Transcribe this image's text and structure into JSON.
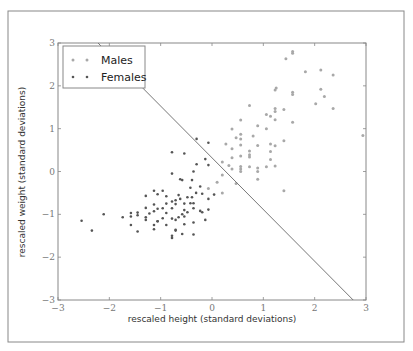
{
  "chart_data": {
    "type": "scatter",
    "title": "",
    "xlabel": "rescaled height (standard deviations)",
    "ylabel": "rescaled weight (standard deviations)",
    "xlim": [
      -3,
      3
    ],
    "ylim": [
      -3,
      3
    ],
    "xticks": [
      -3,
      -2,
      -1,
      0,
      1,
      2,
      3
    ],
    "yticks": [
      -3,
      -2,
      -1,
      0,
      1,
      2,
      3
    ],
    "grid": false,
    "legend_position": "upper left",
    "legend": [
      "Males",
      "Females"
    ],
    "colors": {
      "Males": "#a8a8a8",
      "Females": "#555555",
      "line": "#777777",
      "frame": "#888888"
    },
    "decision_boundary": {
      "x": [
        -2.22,
        2.75
      ],
      "y": [
        3.0,
        -3.0
      ]
    },
    "series": [
      {
        "name": "Males",
        "x": [
          1.44,
          1.57,
          1.57,
          1.25,
          1.82,
          2.12,
          2.36,
          1.23,
          0.73,
          1.23,
          1.4,
          1.57,
          1.57,
          2.02,
          2.19,
          2.12,
          1.57,
          2.36,
          0.56,
          1.06,
          0.89,
          0.39,
          1.14,
          1.23,
          1.23,
          1.06,
          0.8,
          0.89,
          1.4,
          0.27,
          0.56,
          0.39,
          0.73,
          0.56,
          0.47,
          0.56,
          0.39,
          0.56,
          1.14,
          1.14,
          1.14,
          0.73,
          2.94,
          0.2,
          0.33,
          0.56,
          0.56,
          0.89,
          1.06,
          1.23,
          0.2,
          0.39,
          0.56,
          0.73,
          0.89,
          1.4,
          0.2,
          -0.07,
          0.1,
          0.47,
          0.73,
          1.23,
          0.89
        ],
        "y": [
          2.63,
          2.76,
          2.8,
          1.95,
          2.33,
          2.37,
          2.25,
          1.47,
          1.54,
          1.9,
          1.45,
          1.8,
          1.85,
          1.58,
          1.75,
          1.92,
          1.15,
          1.47,
          1.2,
          1.33,
          1.07,
          0.99,
          1.29,
          1.21,
          1.4,
          1.0,
          0.83,
          0.61,
          0.72,
          0.64,
          0.62,
          0.53,
          0.48,
          0.76,
          0.79,
          0.87,
          0.32,
          0.36,
          0.64,
          0.47,
          0.28,
          0.34,
          0.84,
          0.22,
          0.14,
          0.12,
          -0.0,
          0.08,
          0.11,
          0.13,
          -0.08,
          0.06,
          0.06,
          0.11,
          -0.18,
          -0.45,
          -0.5,
          -0.4,
          -0.25,
          -0.28,
          0.39,
          0.6,
          0.0
        ]
      },
      {
        "name": "Females",
        "x": [
          -0.3,
          -0.07,
          -0.3,
          -0.54,
          -0.13,
          -0.78,
          -0.36,
          -0.07,
          -0.39,
          -0.62,
          -0.78,
          -0.96,
          -1.13,
          -1.29,
          -0.58,
          -0.42,
          -1.06,
          -0.65,
          -0.89,
          -0.78,
          -0.62,
          -0.54,
          -0.48,
          -0.31,
          -0.19,
          -0.07,
          0.04,
          -0.23,
          -0.36,
          -0.42,
          -0.54,
          -0.71,
          -0.78,
          -0.89,
          -0.96,
          -1.06,
          -1.13,
          -1.13,
          -1.22,
          -1.29,
          -0.89,
          -0.71,
          -0.58,
          -0.48,
          -0.36,
          -0.23,
          -0.54,
          -0.65,
          -0.78,
          -0.96,
          -1.06,
          -1.29,
          -1.45,
          -1.58,
          -1.29,
          -1.06,
          -0.89,
          -0.71,
          -0.54,
          -0.36,
          -0.13,
          -0.71,
          -1.13,
          -1.13,
          -1.45,
          -1.58,
          -1.58,
          -1.74,
          -2.11,
          -2.34,
          -2.54,
          -1.45,
          -0.78,
          -0.71,
          -0.78,
          -0.58,
          -0.36,
          -0.19,
          -0.07,
          -0.39
        ],
        "y": [
          0.76,
          0.67,
          0.17,
          0.42,
          0.29,
          0.45,
          0.0,
          0.15,
          -0.2,
          -0.18,
          -0.05,
          -0.45,
          -0.45,
          -0.57,
          -0.2,
          -0.38,
          -0.53,
          -0.55,
          -0.58,
          -0.7,
          -0.64,
          -0.75,
          -0.6,
          -0.5,
          -0.52,
          -0.64,
          -0.54,
          -0.35,
          -0.74,
          -0.74,
          -0.9,
          -0.76,
          -0.86,
          -0.97,
          -0.86,
          -0.87,
          -0.77,
          -0.93,
          -0.98,
          -0.85,
          -0.75,
          -0.67,
          -1.0,
          -0.95,
          -0.86,
          -0.92,
          -1.05,
          -1.07,
          -1.1,
          -1.09,
          -1.16,
          -1.07,
          -1.02,
          -1.05,
          -1.13,
          -1.16,
          -1.25,
          -1.13,
          -1.23,
          -1.19,
          -1.13,
          -1.38,
          -1.25,
          -1.35,
          -0.96,
          -0.97,
          -1.25,
          -1.07,
          -1.0,
          -1.38,
          -1.15,
          -1.4,
          -1.55,
          -1.36,
          -1.5,
          -1.46,
          -1.47,
          -0.95,
          -0.89,
          -0.6
        ]
      }
    ]
  },
  "figure": {
    "caption_fragment": ""
  }
}
